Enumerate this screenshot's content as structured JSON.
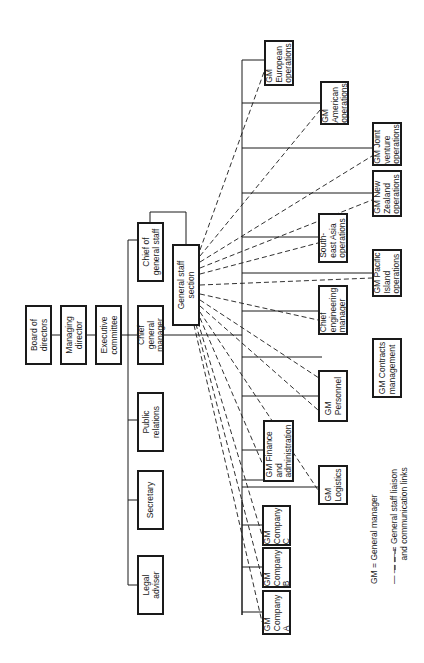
{
  "chart": {
    "orientation": "rotated-90-ccw",
    "nodes": {
      "board": "Board of\ndirectors",
      "managing": "Managing\ndirector",
      "executive": "Executive\ncommittee",
      "chief_staff": "Chief of\ngeneral staff",
      "chief_gm": "Chief\ngeneral\nmanager",
      "public_relations": "Public\nrelations",
      "secretary": "Secretary",
      "legal": "Legal\nadviser",
      "staff_section": "General staff\nsection",
      "company_a": "GM\nCompany\nA",
      "company_b": "GM\nCompany\nB",
      "company_c": "GM\nCompany\nC",
      "finance": "GM Finance\nand\nadministration",
      "logistics": "GM\nLogistics",
      "personnel": "GM\nPersonnel",
      "contracts": "GM Contracts\nmanagement",
      "engineering": "Chief\nengineering\nmanager",
      "pacific": "GM Pacific\nIsland\noperations",
      "se_asia": "South-\neast Asia\noperations",
      "new_zealand": "GM New\nZealand\noperations",
      "joint_venture": "GM Joint\nventure\noperations",
      "american": "GM\nAmerican\noperations",
      "european": "GM\nEuropean\noperations"
    },
    "legend": {
      "gm": "GM = General manager",
      "dashed": "— — — = General staff liaison\n          and communication links"
    }
  }
}
